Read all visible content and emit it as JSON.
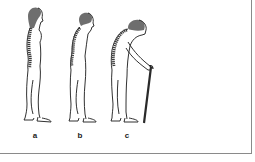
{
  "figure": {
    "panels": [
      {
        "id": "a",
        "label": "a",
        "description": "upright posture, normal spine"
      },
      {
        "id": "b",
        "label": "b",
        "description": "slightly stooped posture, curved spine"
      },
      {
        "id": "c",
        "label": "c",
        "description": "severely stooped posture with walking cane"
      }
    ],
    "colors": {
      "outline": "#1a1a1a",
      "hair": "#6e6e6e",
      "spine": "#3a3a3a",
      "frame_border": "#8a8a8a",
      "background": "#ffffff"
    }
  }
}
